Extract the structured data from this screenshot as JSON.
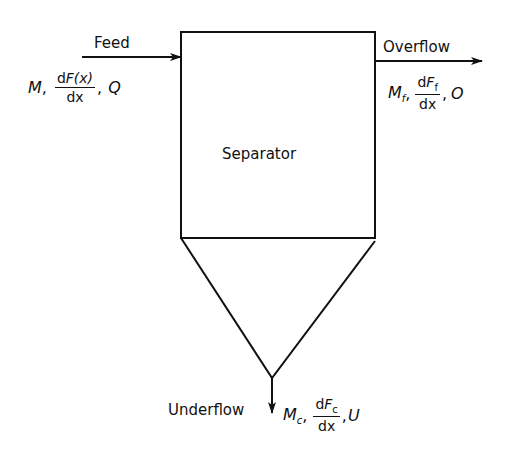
{
  "diagram": {
    "separator": {
      "label": "Separator"
    },
    "feed": {
      "label": "Feed",
      "expr": {
        "m": "M",
        "frac_num_d": "d",
        "frac_num_F": "F",
        "frac_num_arg": "(x)",
        "frac_den": "dx",
        "sep1": ",",
        "sep2": ",",
        "q": "Q"
      }
    },
    "overflow": {
      "label": "Overflow",
      "expr": {
        "m": "M",
        "m_sub": "f",
        "frac_num_d": "d",
        "frac_num_F": "F",
        "frac_num_sub": "f",
        "frac_den": "dx",
        "sep1": ",",
        "sep2": ",",
        "o": "O"
      }
    },
    "underflow": {
      "label": "Underflow",
      "expr": {
        "m": "M",
        "m_sub": "c",
        "frac_num_d": "d",
        "frac_num_F": "F",
        "frac_num_sub": "c",
        "frac_den": "dx",
        "sep1": ",",
        "sep2": ",",
        "u": "U"
      }
    },
    "colors": {
      "line": "#111111",
      "background": "#ffffff"
    }
  }
}
